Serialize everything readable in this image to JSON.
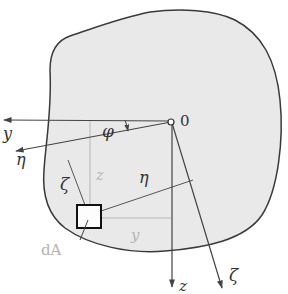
{
  "figure": {
    "colors": {
      "section_fill": "#e9e9e9",
      "outline": "#3a3a3a",
      "axis": "#444444",
      "construction": "#b8b8b8",
      "background": "#ffffff"
    },
    "origin": {
      "label": "0",
      "x": 171,
      "y": 122
    },
    "axes": [
      {
        "name": "y",
        "label": "y",
        "tip": [
          3,
          120
        ]
      },
      {
        "name": "eta",
        "label": "η",
        "tip": [
          15,
          151
        ]
      },
      {
        "name": "z",
        "label": "z",
        "tip": [
          172,
          287
        ]
      },
      {
        "name": "zeta",
        "label": "ζ",
        "tip": [
          222,
          288
        ]
      }
    ],
    "angle": {
      "label": "φ"
    },
    "element": {
      "label": "dA"
    },
    "dimension_labels": {
      "zeta_distance": "ζ",
      "eta_distance": "η",
      "z_distance": "z",
      "y_distance": "y"
    }
  }
}
